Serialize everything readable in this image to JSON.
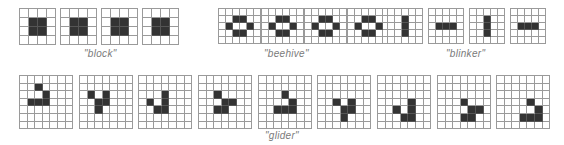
{
  "colors": {
    "live_cell": "#333333",
    "grid_line": "#9a9a9a",
    "label": "#7a7a7a",
    "background": "#ffffff"
  },
  "groups": [
    {
      "name": "block",
      "label": "\"block\"",
      "label_pos": {
        "x": 84,
        "y": 48
      },
      "cols": 4,
      "rows": 4,
      "cell": 9,
      "top": 8,
      "frames": [
        {
          "x": 19,
          "live": [
            [
              1,
              1
            ],
            [
              1,
              2
            ],
            [
              2,
              1
            ],
            [
              2,
              2
            ]
          ]
        },
        {
          "x": 60,
          "live": [
            [
              1,
              1
            ],
            [
              1,
              2
            ],
            [
              2,
              1
            ],
            [
              2,
              2
            ]
          ]
        },
        {
          "x": 101,
          "live": [
            [
              1,
              1
            ],
            [
              1,
              2
            ],
            [
              2,
              1
            ],
            [
              2,
              2
            ]
          ]
        },
        {
          "x": 142,
          "live": [
            [
              1,
              1
            ],
            [
              1,
              2
            ],
            [
              2,
              1
            ],
            [
              2,
              2
            ]
          ]
        }
      ]
    },
    {
      "name": "beehive",
      "label": "\"beehive\"",
      "label_pos": {
        "x": 264,
        "y": 48
      },
      "cols": 6,
      "rows": 5,
      "cell": 7,
      "top": 8,
      "frames": [
        {
          "x": 218,
          "live": [
            [
              1,
              2
            ],
            [
              1,
              3
            ],
            [
              2,
              1
            ],
            [
              2,
              4
            ],
            [
              3,
              2
            ],
            [
              3,
              3
            ]
          ]
        },
        {
          "x": 261,
          "live": [
            [
              1,
              2
            ],
            [
              1,
              3
            ],
            [
              2,
              1
            ],
            [
              2,
              4
            ],
            [
              3,
              2
            ],
            [
              3,
              3
            ]
          ]
        },
        {
          "x": 304,
          "live": [
            [
              1,
              2
            ],
            [
              1,
              3
            ],
            [
              2,
              1
            ],
            [
              2,
              4
            ],
            [
              3,
              2
            ],
            [
              3,
              3
            ]
          ]
        },
        {
          "x": 347,
          "live": [
            [
              1,
              2
            ],
            [
              1,
              3
            ],
            [
              2,
              1
            ],
            [
              2,
              4
            ],
            [
              3,
              2
            ],
            [
              3,
              3
            ]
          ]
        }
      ]
    },
    {
      "name": "blinker",
      "label": "\"blinker\"",
      "label_pos": {
        "x": 446,
        "y": 48
      },
      "cols": 5,
      "rows": 5,
      "cell": 7,
      "top": 8,
      "frames": [
        {
          "x": 387,
          "live": [
            [
              1,
              2
            ],
            [
              2,
              2
            ],
            [
              3,
              2
            ]
          ]
        },
        {
          "x": 428,
          "live": [
            [
              2,
              1
            ],
            [
              2,
              2
            ],
            [
              2,
              3
            ]
          ]
        },
        {
          "x": 469,
          "live": [
            [
              1,
              2
            ],
            [
              2,
              2
            ],
            [
              3,
              2
            ]
          ]
        },
        {
          "x": 510,
          "live": [
            [
              2,
              1
            ],
            [
              2,
              2
            ],
            [
              2,
              3
            ]
          ]
        }
      ]
    },
    {
      "name": "glider",
      "label": "\"glider\"",
      "label_pos": {
        "x": 265,
        "y": 130
      },
      "cols": 7,
      "rows": 7,
      "cell": 7.6,
      "top": 75,
      "frames": [
        {
          "x": 19,
          "live": [
            [
              1,
              2
            ],
            [
              2,
              3
            ],
            [
              3,
              1
            ],
            [
              3,
              2
            ],
            [
              3,
              3
            ]
          ]
        },
        {
          "x": 79,
          "live": [
            [
              2,
              1
            ],
            [
              2,
              3
            ],
            [
              3,
              2
            ],
            [
              3,
              3
            ],
            [
              4,
              2
            ]
          ]
        },
        {
          "x": 138,
          "live": [
            [
              2,
              3
            ],
            [
              3,
              1
            ],
            [
              3,
              3
            ],
            [
              4,
              2
            ],
            [
              4,
              3
            ]
          ]
        },
        {
          "x": 198,
          "live": [
            [
              2,
              2
            ],
            [
              3,
              3
            ],
            [
              3,
              4
            ],
            [
              4,
              2
            ],
            [
              4,
              3
            ]
          ]
        },
        {
          "x": 258,
          "live": [
            [
              2,
              3
            ],
            [
              3,
              4
            ],
            [
              4,
              2
            ],
            [
              4,
              3
            ],
            [
              4,
              4
            ]
          ]
        },
        {
          "x": 317,
          "live": [
            [
              3,
              2
            ],
            [
              3,
              4
            ],
            [
              4,
              3
            ],
            [
              4,
              4
            ],
            [
              5,
              3
            ]
          ]
        },
        {
          "x": 377,
          "live": [
            [
              3,
              4
            ],
            [
              4,
              2
            ],
            [
              4,
              4
            ],
            [
              5,
              3
            ],
            [
              5,
              4
            ]
          ]
        },
        {
          "x": 437,
          "live": [
            [
              3,
              3
            ],
            [
              4,
              4
            ],
            [
              4,
              5
            ],
            [
              5,
              3
            ],
            [
              5,
              4
            ]
          ]
        },
        {
          "x": 496,
          "live": [
            [
              3,
              4
            ],
            [
              4,
              5
            ],
            [
              5,
              3
            ],
            [
              5,
              4
            ],
            [
              5,
              5
            ]
          ]
        }
      ]
    }
  ]
}
